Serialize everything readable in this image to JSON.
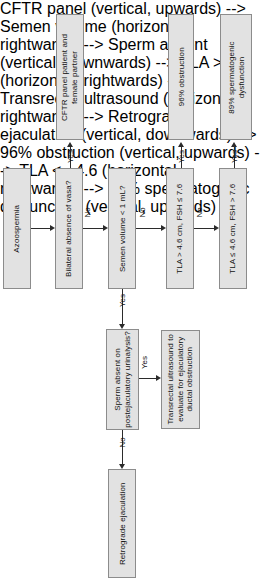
{
  "figure": {
    "type": "flowchart",
    "orientation": "rotated-90-ccw",
    "background_color": "#ffffff",
    "node_fill_color": "#e2e2e2",
    "node_border_color": "#8c8c8c",
    "connector_color": "#2b2b2b"
  },
  "nodes": {
    "azoospermia": "Azoospermia",
    "bilateral_absence_vasa": "Bilateral absence of vasa?",
    "cftr_panel": "CFTR panel patient and female partner",
    "cftr_panel_line1": "CFTR panel patient and",
    "cftr_panel_line2": "female partner",
    "semen_volume": "Semen volume < 1 mL?",
    "sperm_absent": "Sperm absent on postejaculatory urinalysis?",
    "sperm_absent_line1": "Sperm absent on",
    "sperm_absent_line2": "postejaculatory urinalysis?",
    "transrectal_us": "Transrectal ultrasound to evaluate for ejaculatory ductal obstruction",
    "transrectal_us_line1": "Transrectal ultrasound to",
    "transrectal_us_line2": "evaluate for ejaculatory",
    "transrectal_us_line3": "ductal obstruction",
    "retrograde_ejaculation": "Retrograde ejaculation",
    "tla_high": "TLA > 4.6 cm, FSH ≤ 7.6",
    "obstruction_outcome": "96% obstruction",
    "tla_low": "TLA ≤ 4.6 cm, FSH > 7.6",
    "spermatogenic_outcome": "89% spermatogenic dysfunction",
    "spermatogenic_outcome_line1": "89% spermatogenic",
    "spermatogenic_outcome_line2": "dysfunction"
  },
  "edge_labels": {
    "vasa_yes": "Yes",
    "vasa_no": "No",
    "semen_yes": "Yes",
    "semen_no": "No",
    "sperm_yes": "Yes",
    "sperm_no": "No",
    "tla_high_yes": "Yes",
    "tla_high_no": "No",
    "tla_low_yes": "Yes"
  }
}
